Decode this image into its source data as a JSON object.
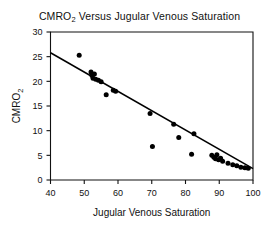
{
  "chart_data": {
    "type": "scatter",
    "title": "CMRO2 Versus Jugular Venous Saturation",
    "title_main": "CMRO",
    "title_sub": "2",
    "title_rest": " Versus Jugular Venous Saturation",
    "xlabel": "Jugular Venous Saturation",
    "ylabel": "CMRO2",
    "ylabel_main": "CMRO",
    "ylabel_sub": "2",
    "xlim": [
      40,
      100
    ],
    "ylim": [
      0,
      30
    ],
    "xticks": [
      40,
      50,
      60,
      70,
      80,
      90,
      100
    ],
    "xtick_labels": [
      "40",
      "50",
      "60",
      "70",
      "80",
      "90",
      "100"
    ],
    "yticks": [
      0,
      5,
      10,
      15,
      20,
      25,
      30
    ],
    "ytick_labels": [
      "0",
      "5",
      "10",
      "15",
      "20",
      "25",
      "30"
    ],
    "grid": false,
    "legend": null,
    "point_color": "#000000",
    "line_color": "#000000",
    "frame_color": "#111111",
    "background": "#ffffff",
    "series": [
      {
        "name": "Observations",
        "marker": "filled-circle",
        "points": [
          [
            48.5,
            25.3
          ],
          [
            52.0,
            21.9
          ],
          [
            52.3,
            21.2
          ],
          [
            52.6,
            20.6
          ],
          [
            53.0,
            21.5
          ],
          [
            53.4,
            20.4
          ],
          [
            54.2,
            20.2
          ],
          [
            55.0,
            19.9
          ],
          [
            56.5,
            17.3
          ],
          [
            58.6,
            18.2
          ],
          [
            59.3,
            18.0
          ],
          [
            69.5,
            13.5
          ],
          [
            70.2,
            6.8
          ],
          [
            76.5,
            11.3
          ],
          [
            78.0,
            8.6
          ],
          [
            81.8,
            5.2
          ],
          [
            82.5,
            9.4
          ],
          [
            87.8,
            5.0
          ],
          [
            88.4,
            4.6
          ],
          [
            88.9,
            4.3
          ],
          [
            89.3,
            5.1
          ],
          [
            89.8,
            4.1
          ],
          [
            90.4,
            4.4
          ],
          [
            91.0,
            3.8
          ],
          [
            92.6,
            3.4
          ],
          [
            94.0,
            3.1
          ],
          [
            95.2,
            2.9
          ],
          [
            96.4,
            2.6
          ],
          [
            97.6,
            2.5
          ],
          [
            98.6,
            2.4
          ]
        ]
      }
    ],
    "fit_line": {
      "name": "Regression line",
      "x_start": 40,
      "y_start": 25.8,
      "x_end": 100,
      "y_end": 2.3,
      "slope": -0.392,
      "intercept": 41.48
    }
  }
}
